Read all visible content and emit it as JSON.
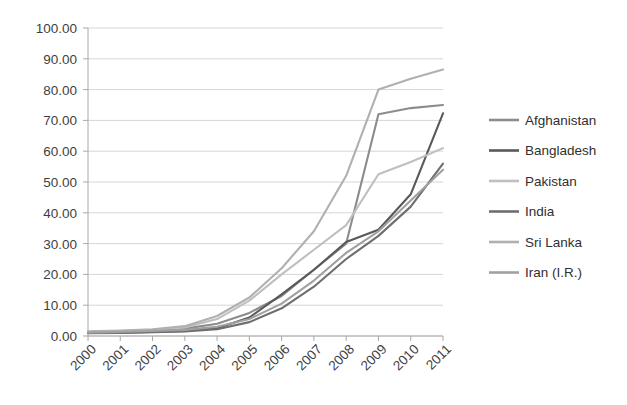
{
  "chart_data": {
    "type": "line",
    "title": "",
    "subtitle": "",
    "xlabel": "",
    "ylabel": "",
    "grid": true,
    "legend_position": "right",
    "categories": [
      "2000",
      "2001",
      "2002",
      "2003",
      "2004",
      "2005",
      "2006",
      "2007",
      "2008",
      "2009",
      "2010",
      "2011"
    ],
    "x": [
      2000,
      2001,
      2002,
      2003,
      2004,
      2005,
      2006,
      2007,
      2008,
      2009,
      2010,
      2011
    ],
    "xlim": [
      2000,
      2011
    ],
    "ylim": [
      0,
      100
    ],
    "y_ticks": [
      "0.00",
      "10.00",
      "20.00",
      "30.00",
      "40.00",
      "50.00",
      "60.00",
      "70.00",
      "80.00",
      "90.00",
      "100.00"
    ],
    "y_tick_values": [
      0,
      10,
      20,
      30,
      40,
      50,
      60,
      70,
      80,
      90,
      100
    ],
    "x_tick_labels": [
      "2000",
      "2001",
      "2002",
      "2003",
      "2004",
      "2005",
      "2006",
      "2007",
      "2008",
      "2009",
      "2010",
      "2011"
    ],
    "series": [
      {
        "name": "Afghanistan",
        "color": "#8c8c8c",
        "values": [
          1.2,
          1.4,
          1.8,
          2.4,
          4.0,
          7.5,
          13.0,
          21.5,
          30.0,
          72.0,
          74.0,
          75.0
        ]
      },
      {
        "name": "Bangladesh",
        "color": "#595959",
        "values": [
          1.0,
          1.1,
          1.3,
          1.6,
          2.5,
          6.0,
          13.5,
          21.5,
          30.5,
          34.5,
          46.0,
          72.3
        ]
      },
      {
        "name": "Pakistan",
        "color": "#bfbfbf",
        "values": [
          1.3,
          1.6,
          2.0,
          2.8,
          5.5,
          11.5,
          20.0,
          28.0,
          36.0,
          52.5,
          56.5,
          61.0
        ]
      },
      {
        "name": "India",
        "color": "#6e6e6e",
        "values": [
          0.9,
          1.0,
          1.2,
          1.5,
          2.2,
          4.5,
          9.0,
          16.0,
          25.0,
          32.5,
          42.0,
          56.0
        ]
      },
      {
        "name": "Sri Lanka",
        "color": "#b0b0b0",
        "values": [
          1.5,
          1.8,
          2.2,
          3.2,
          6.5,
          12.5,
          22.0,
          34.0,
          52.0,
          80.0,
          83.5,
          86.5
        ]
      },
      {
        "name": "Iran (I.R.)",
        "color": "#a0a0a0",
        "values": [
          1.1,
          1.3,
          1.6,
          2.0,
          3.0,
          5.5,
          10.5,
          18.0,
          27.0,
          34.0,
          44.0,
          54.0
        ]
      }
    ]
  },
  "legend": {
    "items": [
      {
        "label": "Afghanistan"
      },
      {
        "label": "Bangladesh"
      },
      {
        "label": "Pakistan"
      },
      {
        "label": "India"
      },
      {
        "label": "Sri Lanka"
      },
      {
        "label": "Iran (I.R.)"
      }
    ]
  }
}
